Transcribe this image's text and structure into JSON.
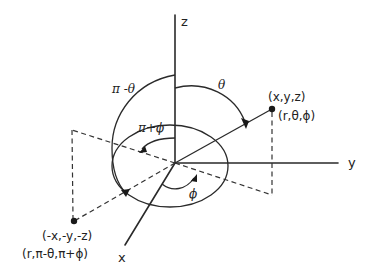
{
  "diagram": {
    "type": "spherical-coordinates-inversion",
    "axes": {
      "z_label": "z",
      "y_label": "y",
      "x_label": "x"
    },
    "points": {
      "p": {
        "cartesian": "(x,y,z)",
        "spherical": "(r,θ,ϕ)"
      },
      "inverted": {
        "cartesian": "(-x,-y,-z)",
        "spherical": "(r,π-θ,π+ϕ)"
      }
    },
    "angles": {
      "theta": "θ",
      "pi_minus_theta": "π -θ",
      "pi_plus_phi": "π+ϕ",
      "phi": "ϕ"
    },
    "colors": {
      "ink": "#2a2a2a",
      "background": "#ffffff"
    }
  }
}
